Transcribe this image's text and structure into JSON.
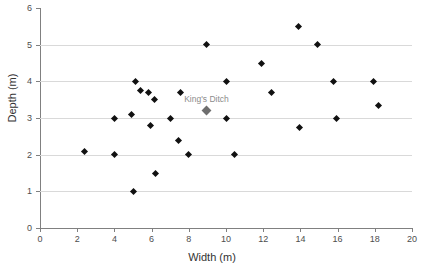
{
  "chart_data": {
    "type": "scatter",
    "title": "",
    "xlabel": "Width (m)",
    "ylabel": "Depth (m)",
    "xlim": [
      0,
      20
    ],
    "ylim": [
      0,
      6
    ],
    "xticks": [
      0,
      2,
      4,
      6,
      8,
      10,
      12,
      14,
      16,
      18,
      20
    ],
    "yticks": [
      0,
      1,
      2,
      3,
      4,
      5,
      6
    ],
    "xtick_labels": [
      "0",
      "2",
      "4",
      "6",
      "8",
      "10",
      "12",
      "14",
      "16",
      "18",
      "20"
    ],
    "ytick_labels": [
      "0",
      "1",
      "2",
      "3",
      "4",
      "5",
      "6"
    ],
    "grid": "horizontal",
    "legend": "none",
    "marker": "diamond",
    "marker_color": "#111111",
    "highlight_color": "#6e6e6e",
    "gridline_color": "#d9d9d9",
    "axis_color": "#808080",
    "points": [
      {
        "x": 2.4,
        "y": 2.1,
        "highlight": false
      },
      {
        "x": 4.0,
        "y": 3.0,
        "highlight": false
      },
      {
        "x": 4.0,
        "y": 2.0,
        "highlight": false
      },
      {
        "x": 4.9,
        "y": 3.1,
        "highlight": false
      },
      {
        "x": 5.0,
        "y": 1.0,
        "highlight": false
      },
      {
        "x": 5.15,
        "y": 4.0,
        "highlight": false
      },
      {
        "x": 5.4,
        "y": 3.75,
        "highlight": false
      },
      {
        "x": 5.85,
        "y": 3.7,
        "highlight": false
      },
      {
        "x": 5.95,
        "y": 2.8,
        "highlight": false
      },
      {
        "x": 6.15,
        "y": 3.5,
        "highlight": false
      },
      {
        "x": 6.2,
        "y": 1.5,
        "highlight": false
      },
      {
        "x": 7.0,
        "y": 3.0,
        "highlight": false
      },
      {
        "x": 7.45,
        "y": 2.4,
        "highlight": false
      },
      {
        "x": 7.55,
        "y": 3.7,
        "highlight": false
      },
      {
        "x": 8.0,
        "y": 2.0,
        "highlight": false
      },
      {
        "x": 8.95,
        "y": 5.0,
        "highlight": false
      },
      {
        "x": 8.95,
        "y": 3.2,
        "highlight": true,
        "label": "King's Ditch"
      },
      {
        "x": 10.0,
        "y": 4.0,
        "highlight": false
      },
      {
        "x": 10.0,
        "y": 3.0,
        "highlight": false
      },
      {
        "x": 10.45,
        "y": 2.0,
        "highlight": false
      },
      {
        "x": 11.9,
        "y": 4.5,
        "highlight": false
      },
      {
        "x": 12.45,
        "y": 3.7,
        "highlight": false
      },
      {
        "x": 13.9,
        "y": 5.5,
        "highlight": false
      },
      {
        "x": 13.95,
        "y": 2.75,
        "highlight": false
      },
      {
        "x": 14.9,
        "y": 5.0,
        "highlight": false
      },
      {
        "x": 15.8,
        "y": 4.0,
        "highlight": false
      },
      {
        "x": 15.95,
        "y": 3.0,
        "highlight": false
      },
      {
        "x": 17.95,
        "y": 4.0,
        "highlight": false
      },
      {
        "x": 18.2,
        "y": 3.35,
        "highlight": false
      }
    ],
    "annotations": [
      {
        "text": "King's Ditch",
        "x": 8.95,
        "y": 3.2,
        "color": "#8c8c8c"
      }
    ]
  }
}
